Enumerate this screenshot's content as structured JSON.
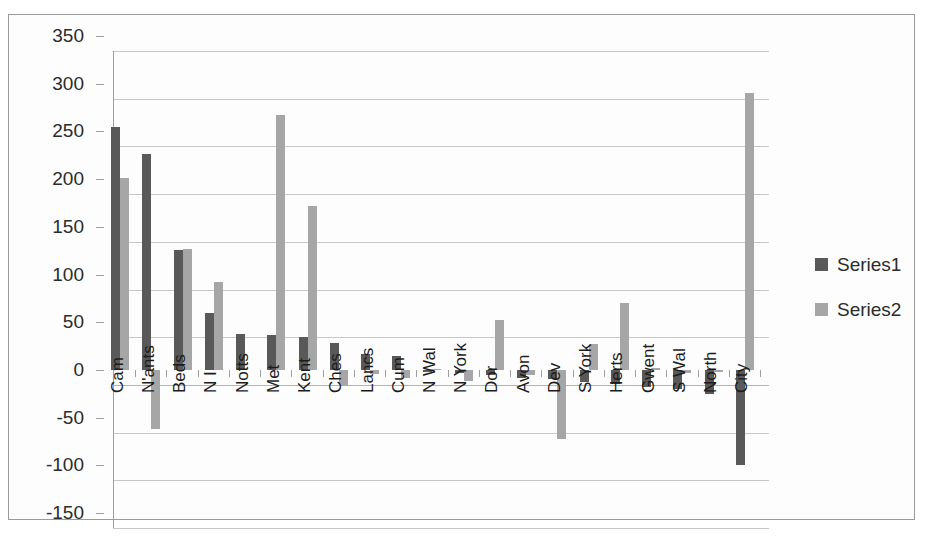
{
  "chart_data": {
    "type": "bar",
    "title": "",
    "xlabel": "",
    "ylabel": "",
    "ylim": [
      -150,
      350
    ],
    "ytick_step": 50,
    "yticks": [
      350,
      300,
      250,
      200,
      150,
      100,
      50,
      0,
      -50,
      -100,
      -150
    ],
    "ytick_labels": [
      "350",
      "300",
      "250",
      "200",
      "150",
      "100",
      "50",
      "0",
      "-50",
      "-100",
      "-150"
    ],
    "grid": true,
    "legend_position": "right",
    "categories": [
      "Cam",
      "N'ants",
      "Beds",
      "N I",
      "Notts",
      "Met",
      "Kent",
      "Ches",
      "Lancs",
      "Cum",
      "N Wal",
      "N York",
      "Dor",
      "Avon",
      "Dev",
      "S York",
      "Herts",
      "Gwent",
      "S Wal",
      "North",
      "City"
    ],
    "series": [
      {
        "name": "Series1",
        "color": "#595959",
        "values": [
          255,
          226,
          126,
          60,
          38,
          37,
          35,
          28,
          17,
          15,
          -2,
          -3,
          -5,
          -8,
          -10,
          -13,
          -15,
          -18,
          -20,
          -25,
          -100
        ]
      },
      {
        "name": "Series2",
        "color": "#a6a6a6",
        "values": [
          201,
          -62,
          127,
          92,
          0,
          267,
          172,
          -17,
          -4,
          -9,
          1,
          -12,
          52,
          -5,
          -72,
          27,
          70,
          2,
          -3,
          -2,
          290
        ]
      }
    ]
  },
  "legend": {
    "items": [
      {
        "label": "Series1",
        "color": "#595959"
      },
      {
        "label": "Series2",
        "color": "#a6a6a6"
      }
    ]
  }
}
